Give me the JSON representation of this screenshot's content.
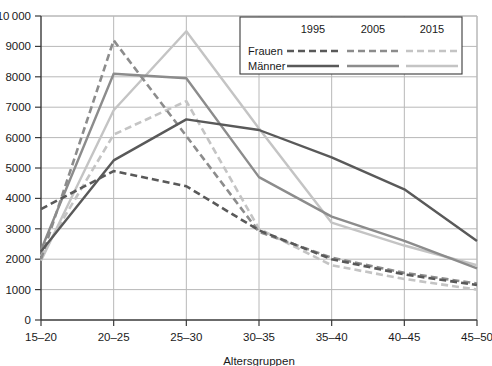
{
  "chart_data": {
    "type": "line",
    "title": "",
    "xlabel": "Altersgruppen",
    "ylabel": "",
    "categories": [
      "15–20",
      "20–25",
      "25–30",
      "30–35",
      "35–40",
      "40–45",
      "45–50"
    ],
    "ylim": [
      0,
      10000
    ],
    "ytick_step": 1000,
    "yticks": [
      "0",
      "1000",
      "2000",
      "3000",
      "4000",
      "5000",
      "6000",
      "7000",
      "8000",
      "9000",
      "10 000"
    ],
    "ytick_values": [
      0,
      1000,
      2000,
      3000,
      4000,
      5000,
      6000,
      7000,
      8000,
      9000,
      10000
    ],
    "grid": true,
    "legend_position": "top-right",
    "series": [
      {
        "name": "Frauen 1995",
        "group": "Frauen",
        "year": "1995",
        "style": "dashed",
        "color": "#595959",
        "values": [
          3650,
          4900,
          4400,
          2950,
          2000,
          1500,
          1150
        ]
      },
      {
        "name": "Frauen 2005",
        "group": "Frauen",
        "year": "2005",
        "style": "dashed",
        "color": "#8c8c8c",
        "values": [
          2000,
          9200,
          6050,
          2900,
          2050,
          1550,
          1200
        ]
      },
      {
        "name": "Frauen 2015",
        "group": "Frauen",
        "year": "2015",
        "style": "dashed",
        "color": "#c4c4c4",
        "values": [
          2100,
          6100,
          7200,
          3000,
          1800,
          1350,
          1000
        ]
      },
      {
        "name": "Männer 1995",
        "group": "Männer",
        "year": "1995",
        "style": "solid",
        "color": "#595959",
        "values": [
          2250,
          5250,
          6600,
          6250,
          5350,
          4300,
          2600
        ]
      },
      {
        "name": "Männer 2005",
        "group": "Männer",
        "year": "2005",
        "style": "solid",
        "color": "#8c8c8c",
        "values": [
          2300,
          8100,
          7950,
          4700,
          3400,
          2600,
          1700
        ]
      },
      {
        "name": "Männer 2015",
        "group": "Männer",
        "year": "2015",
        "style": "solid",
        "color": "#c4c4c4",
        "values": [
          1950,
          6900,
          9500,
          6300,
          3200,
          2450,
          1800
        ]
      }
    ]
  },
  "legend": {
    "years": [
      "1995",
      "2005",
      "2015"
    ],
    "rows": [
      "Frauen",
      "Männer"
    ]
  },
  "colors": {
    "s1995": "#595959",
    "s2005": "#8c8c8c",
    "s2015": "#c4c4c4",
    "grid": "#b8b8b8",
    "axis": "#3a3a3a"
  }
}
